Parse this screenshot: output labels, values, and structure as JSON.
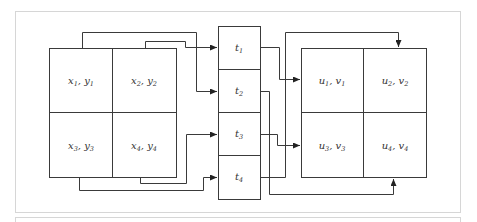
{
  "diagram": {
    "colors": {
      "line": "#3a3a3a",
      "frame": "#d6d6d6",
      "text": "#333333"
    },
    "left_grid": {
      "cells": [
        {
          "var1": "x",
          "sub1": "1",
          "var2": "y",
          "sub2": "1"
        },
        {
          "var1": "x",
          "sub1": "2",
          "var2": "y",
          "sub2": "2"
        },
        {
          "var1": "x",
          "sub1": "3",
          "var2": "y",
          "sub2": "3"
        },
        {
          "var1": "x",
          "sub1": "4",
          "var2": "y",
          "sub2": "4"
        }
      ]
    },
    "middle_column": {
      "cells": [
        {
          "var": "t",
          "sub": "1"
        },
        {
          "var": "t",
          "sub": "2"
        },
        {
          "var": "t",
          "sub": "3"
        },
        {
          "var": "t",
          "sub": "4"
        }
      ]
    },
    "right_grid": {
      "cells": [
        {
          "var1": "u",
          "sub1": "1",
          "var2": "v",
          "sub2": "1"
        },
        {
          "var1": "u",
          "sub1": "2",
          "var2": "v",
          "sub2": "2"
        },
        {
          "var1": "u",
          "sub1": "3",
          "var2": "v",
          "sub2": "3"
        },
        {
          "var1": "u",
          "sub1": "4",
          "var2": "v",
          "sub2": "4"
        }
      ]
    },
    "connections": [
      {
        "from": "x1,y1",
        "to": "t2"
      },
      {
        "from": "x2,y2",
        "to": "t1"
      },
      {
        "from": "x3,y3",
        "to": "t4"
      },
      {
        "from": "x4,y4",
        "to": "t3"
      },
      {
        "from": "t1",
        "to": "u1,v1"
      },
      {
        "from": "t2",
        "to": "u4,v4"
      },
      {
        "from": "t3",
        "to": "u3,v3"
      },
      {
        "from": "t4",
        "to": "u2,v2"
      }
    ]
  }
}
